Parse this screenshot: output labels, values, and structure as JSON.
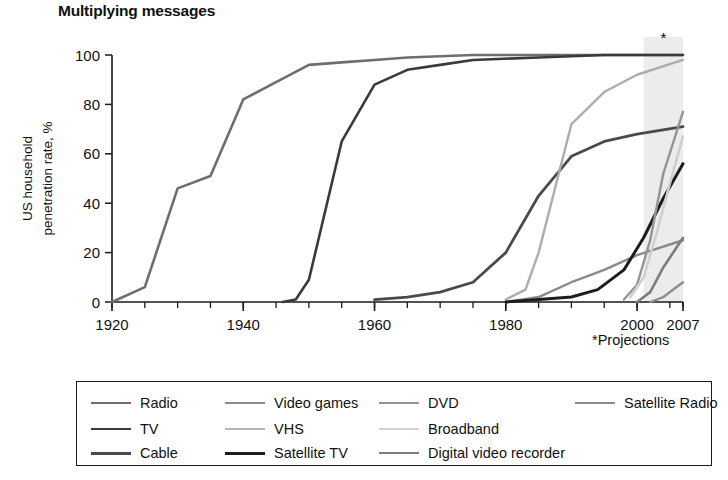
{
  "header": {
    "title": "Multiplying messages"
  },
  "footnote": {
    "projection_note": "*Projections",
    "projection_marker": "*"
  },
  "chart_data": {
    "type": "line",
    "title": "Multiplying messages",
    "xlabel": "",
    "ylabel": "US household penetration rate, %",
    "ylabel_line1": "US household",
    "ylabel_line2": "penetration rate, %",
    "xlim": [
      1920,
      2007
    ],
    "ylim": [
      0,
      100
    ],
    "grid": false,
    "legend_position": "bottom",
    "x_ticks": [
      1920,
      1940,
      1960,
      1980,
      2000,
      2007
    ],
    "x_tick_labels": [
      "1920",
      "1940",
      "1960",
      "1980",
      "2000",
      "2007"
    ],
    "x_minor_tick_step": 5,
    "y_ticks": [
      0,
      20,
      40,
      60,
      80,
      100
    ],
    "y_tick_labels": [
      "0",
      "20",
      "40",
      "60",
      "80",
      "100"
    ],
    "projection_band": [
      2001,
      2007
    ],
    "annotations": [
      {
        "text": "*",
        "x": 2004,
        "y": 106
      },
      {
        "text": "*Projections",
        "x": 2002,
        "y": -22
      }
    ],
    "series": [
      {
        "name": "Radio",
        "color": "#6e6e6e",
        "width": 2.6,
        "x": [
          1920,
          1925,
          1930,
          1935,
          1940,
          1945,
          1950,
          1955,
          1960,
          1965,
          1975,
          1990,
          2007
        ],
        "y": [
          0,
          6,
          46,
          51,
          82,
          89,
          96,
          97,
          98,
          99,
          100,
          100,
          100
        ]
      },
      {
        "name": "TV",
        "color": "#3a3a3a",
        "width": 2.6,
        "x": [
          1946,
          1948,
          1950,
          1955,
          1960,
          1965,
          1970,
          1975,
          1985,
          1995,
          2007
        ],
        "y": [
          0,
          1,
          9,
          65,
          88,
          94,
          96,
          98,
          99,
          100,
          100
        ]
      },
      {
        "name": "Cable",
        "color": "#4a4a4a",
        "width": 2.8,
        "x": [
          1960,
          1965,
          1970,
          1975,
          1980,
          1985,
          1990,
          1995,
          2000,
          2007
        ],
        "y": [
          1,
          2,
          4,
          8,
          20,
          43,
          59,
          65,
          68,
          71
        ]
      },
      {
        "name": "Video games",
        "color": "#8a8a8a",
        "width": 2.4,
        "x": [
          1980,
          1985,
          1990,
          1995,
          2000,
          2007
        ],
        "y": [
          0,
          2,
          8,
          13,
          19,
          25
        ]
      },
      {
        "name": "VHS",
        "color": "#adadad",
        "width": 2.4,
        "x": [
          1980,
          1983,
          1985,
          1990,
          1995,
          2000,
          2007
        ],
        "y": [
          1,
          5,
          20,
          72,
          85,
          92,
          98
        ]
      },
      {
        "name": "Satellite TV",
        "color": "#1c1c1c",
        "width": 3.0,
        "x": [
          1980,
          1985,
          1990,
          1994,
          1998,
          2001,
          2004,
          2007
        ],
        "y": [
          0,
          1,
          2,
          5,
          13,
          26,
          42,
          56
        ]
      },
      {
        "name": "DVD",
        "color": "#949494",
        "width": 2.4,
        "x": [
          1998,
          2000,
          2002,
          2004,
          2007
        ],
        "y": [
          1,
          7,
          25,
          52,
          77
        ]
      },
      {
        "name": "Broadband",
        "color": "#cfcfcf",
        "width": 2.6,
        "x": [
          1999,
          2001,
          2003,
          2005,
          2007
        ],
        "y": [
          2,
          10,
          28,
          48,
          67
        ]
      },
      {
        "name": "Digital video recorder",
        "color": "#7d7d7d",
        "width": 2.6,
        "x": [
          2000,
          2002,
          2004,
          2007
        ],
        "y": [
          0,
          4,
          14,
          26
        ]
      },
      {
        "name": "Satellite Radio",
        "color": "#8d8d8d",
        "width": 2.4,
        "x": [
          2002,
          2004,
          2007
        ],
        "y": [
          0,
          2,
          8
        ]
      }
    ]
  },
  "legend": {
    "columns": [
      [
        {
          "label": "Radio",
          "color": "#6e6e6e",
          "width": 2.6
        },
        {
          "label": "TV",
          "color": "#3a3a3a",
          "width": 2.8
        },
        {
          "label": "Cable",
          "color": "#4a4a4a",
          "width": 3.0
        }
      ],
      [
        {
          "label": "Video games",
          "color": "#8a8a8a",
          "width": 2.4
        },
        {
          "label": "VHS",
          "color": "#b5b5b5",
          "width": 2.2
        },
        {
          "label": "Satellite TV",
          "color": "#1c1c1c",
          "width": 3.4
        }
      ],
      [
        {
          "label": "DVD",
          "color": "#949494",
          "width": 2.4
        },
        {
          "label": "Broadband",
          "color": "#d2d2d2",
          "width": 2.6
        },
        {
          "label": "Digital video recorder",
          "color": "#7d7d7d",
          "width": 2.8
        }
      ],
      [
        {
          "label": "Satellite Radio",
          "color": "#8d8d8d",
          "width": 2.4
        }
      ]
    ]
  }
}
